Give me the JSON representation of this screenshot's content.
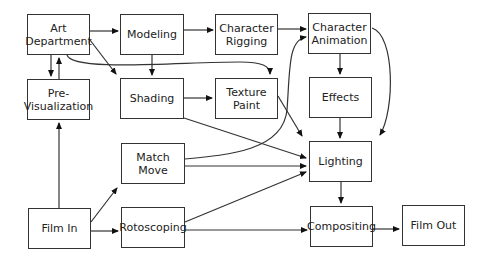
{
  "diagram": {
    "nodes": [
      {
        "id": "art",
        "label": "Art\nDepartment",
        "x": 27,
        "y": 14,
        "w": 63,
        "h": 41
      },
      {
        "id": "model",
        "label": "Modeling",
        "x": 120,
        "y": 14,
        "w": 64,
        "h": 41
      },
      {
        "id": "rig",
        "label": "Character\nRigging",
        "x": 215,
        "y": 14,
        "w": 63,
        "h": 41
      },
      {
        "id": "anim",
        "label": "Character\nAnimation",
        "x": 308,
        "y": 13,
        "w": 63,
        "h": 41
      },
      {
        "id": "previs",
        "label": "Pre-\nVisualization",
        "x": 27,
        "y": 79,
        "w": 63,
        "h": 41
      },
      {
        "id": "shade",
        "label": "Shading",
        "x": 120,
        "y": 78,
        "w": 64,
        "h": 41
      },
      {
        "id": "texture",
        "label": "Texture\nPaint",
        "x": 215,
        "y": 78,
        "w": 63,
        "h": 41
      },
      {
        "id": "effects",
        "label": "Effects",
        "x": 309,
        "y": 77,
        "w": 63,
        "h": 41
      },
      {
        "id": "match",
        "label": "Match\nMove",
        "x": 121,
        "y": 143,
        "w": 64,
        "h": 41
      },
      {
        "id": "light",
        "label": "Lighting",
        "x": 309,
        "y": 141,
        "w": 63,
        "h": 41
      },
      {
        "id": "filmin",
        "label": "Film In",
        "x": 28,
        "y": 208,
        "w": 63,
        "h": 41
      },
      {
        "id": "roto",
        "label": "Rotoscoping",
        "x": 121,
        "y": 207,
        "w": 64,
        "h": 41
      },
      {
        "id": "comp",
        "label": "Compositing",
        "x": 310,
        "y": 206,
        "w": 63,
        "h": 41
      },
      {
        "id": "filmout",
        "label": "Film Out",
        "x": 402,
        "y": 205,
        "w": 63,
        "h": 41
      }
    ],
    "edges": [
      {
        "from": "art",
        "to": "model",
        "d": "M90,31 L118,31"
      },
      {
        "from": "model",
        "to": "rig",
        "d": "M184,30 L213,30"
      },
      {
        "from": "rig",
        "to": "anim",
        "d": "M278,29 L306,29"
      },
      {
        "from": "art",
        "to": "shade",
        "d": "M90,40 L116,74"
      },
      {
        "from": "art",
        "to": "texture",
        "d": "M67,55 C72,72 180,62 240,62 C262,62 270,66 270,74"
      },
      {
        "from": "art",
        "to": "previs",
        "d": "M51,55 L51,76"
      },
      {
        "from": "previs",
        "to": "art",
        "d": "M59,79 L59,58"
      },
      {
        "from": "model",
        "to": "shade",
        "d": "M152,55 L152,75"
      },
      {
        "from": "shade",
        "to": "texture",
        "d": "M184,98 L212,98"
      },
      {
        "from": "anim",
        "to": "effects",
        "d": "M340,54 L340,74"
      },
      {
        "from": "anim",
        "to": "light",
        "d": "M372,28 C395,35 395,110 380,135"
      },
      {
        "from": "effects",
        "to": "light",
        "d": "M340,118 L340,138"
      },
      {
        "from": "texture",
        "to": "light",
        "d": "M278,96 L302,136"
      },
      {
        "from": "shade",
        "to": "light",
        "d": "M184,118 L306,158"
      },
      {
        "from": "match",
        "to": "anim",
        "d": "M185,159 C230,155 283,150 287,110 C290,70 288,40 306,37"
      },
      {
        "from": "match",
        "to": "light",
        "d": "M185,166 L306,166"
      },
      {
        "from": "roto",
        "to": "light",
        "d": "M185,222 L306,172"
      },
      {
        "from": "filmin",
        "to": "previs",
        "d": "M59,208 L59,123"
      },
      {
        "from": "filmin",
        "to": "match",
        "d": "M91,222 L117,188"
      },
      {
        "from": "filmin",
        "to": "roto",
        "d": "M91,231 L118,231"
      },
      {
        "from": "roto",
        "to": "comp",
        "d": "M185,230 L307,230"
      },
      {
        "from": "light",
        "to": "comp",
        "d": "M341,182 L341,203"
      },
      {
        "from": "comp",
        "to": "filmout",
        "d": "M373,229 L399,229"
      }
    ]
  }
}
